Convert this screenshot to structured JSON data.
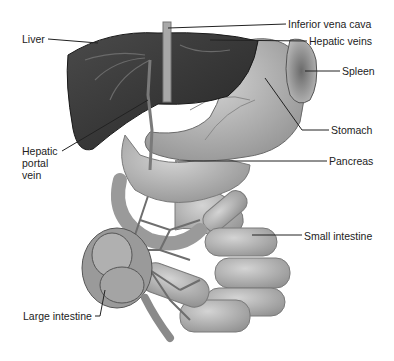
{
  "figure": {
    "style": "grayscale anatomical illustration"
  },
  "labels": {
    "liver": "Liver",
    "inferior_vena_cava": "Inferior vena cava",
    "hepatic_veins": "Hepatic veins",
    "spleen": "Spleen",
    "stomach": "Stomach",
    "pancreas": "Pancreas",
    "hepatic_portal_vein": [
      "Hepatic",
      "portal",
      "vein"
    ],
    "small_intestine": "Small intestine",
    "large_intestine": "Large intestine"
  },
  "colors": {
    "liver": "#3f3f3f",
    "liver_dark": "#2a2a2a",
    "organ_light": "#bdbdbd",
    "organ_mid": "#a0a0a0",
    "vessel": "#8a8a8a",
    "leader_line": "#222222",
    "background": "#ffffff"
  }
}
